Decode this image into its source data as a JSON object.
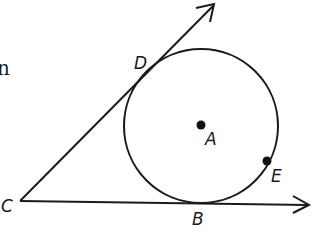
{
  "diagram": {
    "title": "",
    "stroke_color": "#1a1a1a",
    "background": "#ffffff",
    "cropped_text_fragment": "n",
    "circle": {
      "center_label": "A",
      "cx": 201,
      "cy": 126,
      "r": 77
    },
    "points": {
      "A": {
        "label": "A",
        "x": 201,
        "y": 125,
        "role": "center"
      },
      "B": {
        "label": "B",
        "x": 197,
        "y": 203,
        "role": "point of tangency on ray CB"
      },
      "C": {
        "label": "C",
        "x": 20,
        "y": 201,
        "role": "external point / vertex of rays"
      },
      "D": {
        "label": "D",
        "x": 139,
        "y": 86,
        "role": "point of tangency on ray CD"
      },
      "E": {
        "label": "E",
        "x": 267,
        "y": 161,
        "role": "point on circle"
      }
    },
    "rays": [
      {
        "name": "ray-CD",
        "from": "C",
        "through": "D",
        "end": [
          214,
          4
        ]
      },
      {
        "name": "ray-CB",
        "from": "C",
        "through": "B",
        "end": [
          309,
          205
        ]
      }
    ]
  }
}
